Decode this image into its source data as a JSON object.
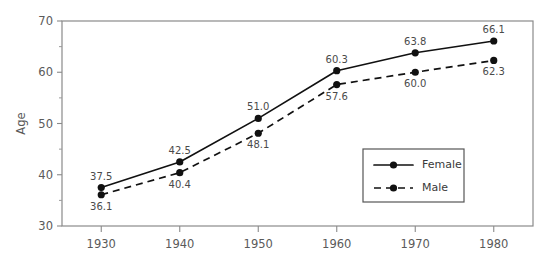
{
  "chart_data": {
    "type": "line",
    "title": "",
    "xlabel": "",
    "ylabel": "Age",
    "x": [
      1930,
      1940,
      1950,
      1960,
      1970,
      1980
    ],
    "categories": [
      "1930",
      "1940",
      "1950",
      "1960",
      "1970",
      "1980"
    ],
    "xlim": [
      1925,
      1985
    ],
    "ylim": [
      30,
      70
    ],
    "y_major_ticks": [
      30,
      40,
      50,
      60,
      70
    ],
    "y_minor_ticks": [
      35,
      45,
      55,
      65
    ],
    "y_tick_labels": [
      "30",
      "40",
      "50",
      "60",
      "70"
    ],
    "x_tick_labels": [
      "1930",
      "1940",
      "1950",
      "1960",
      "1970",
      "1980"
    ],
    "grid": false,
    "legend_position": "lower-right-inside",
    "series": [
      {
        "name": "Female",
        "style": "solid",
        "marker": "filled-circle",
        "color": "#111111",
        "label_position": "above",
        "values": [
          37.5,
          42.5,
          51.0,
          60.3,
          63.8,
          66.1
        ],
        "value_labels": [
          "37.5",
          "42.5",
          "51.0",
          "60.3",
          "63.8",
          "66.1"
        ]
      },
      {
        "name": "Male",
        "style": "dashed",
        "marker": "filled-circle",
        "color": "#111111",
        "label_position": "below",
        "values": [
          36.1,
          40.4,
          48.1,
          57.6,
          60.0,
          62.3
        ],
        "value_labels": [
          "36.1",
          "40.4",
          "48.1",
          "57.6",
          "60.0",
          "62.3"
        ]
      }
    ]
  },
  "legend": {
    "entries": [
      {
        "label": "Female",
        "style": "solid"
      },
      {
        "label": "Male",
        "style": "dashed"
      }
    ]
  },
  "colors": {
    "background": "#ffffff",
    "frame": "#8a8a8a",
    "series": "#111111",
    "tick_text": "#5a5a5a",
    "label_text": "#4a4a4a"
  }
}
